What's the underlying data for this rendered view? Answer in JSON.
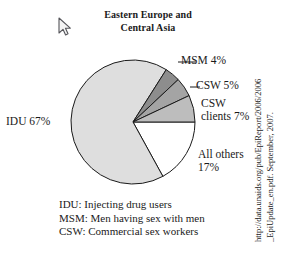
{
  "figure": {
    "title_line1": "Eastern Europe and",
    "title_line2": "Central Asia"
  },
  "cursor": {
    "icon": "mouse-pointer-arrow-icon",
    "x": 57,
    "y": 17
  },
  "labels": {
    "idu": "IDU 67%",
    "msm": "MSM 4%",
    "csw": "CSW 5%",
    "csw_clients_line1": "CSW",
    "csw_clients_line2": "clients 7%",
    "all_others_line1": "All others",
    "all_others_line2": "17%"
  },
  "legend": {
    "items": [
      "IDU: Injecting drug users",
      "MSM: Men having sex with men",
      "CSW: Commercial sex workers"
    ]
  },
  "source": {
    "line1": "http://data.unaids.org/pub/EpiReport/2006/2006",
    "line2": "_EpiUpdate_en.pdf. September, 2007."
  },
  "chart_data": {
    "type": "pie",
    "title": "Eastern Europe and Central Asia",
    "subtitle": "",
    "xlabel": "",
    "ylabel": "",
    "unit": "percent",
    "legend_position": "bottom",
    "grid": false,
    "start_angle_deg": 0,
    "direction": "clockwise",
    "center": {
      "x": 133,
      "y": 122
    },
    "radius": 62,
    "categories": [
      "IDU",
      "MSM",
      "CSW",
      "CSW clients",
      "All others"
    ],
    "values": [
      67,
      4,
      5,
      7,
      17
    ],
    "colors": [
      "#dedede",
      "#8d8d8d",
      "#a4a4a4",
      "#bdbdbd",
      "#ffffff"
    ],
    "stroke": "#1a1a1a",
    "slices": [
      {
        "label": "IDU 67%",
        "category": "IDU",
        "value": 67,
        "color": "#dedede",
        "label_position": "outside-left"
      },
      {
        "label": "MSM 4%",
        "category": "MSM",
        "value": 4,
        "color": "#8d8d8d",
        "label_position": "outside-right"
      },
      {
        "label": "CSW 5%",
        "category": "CSW",
        "value": 5,
        "color": "#a4a4a4",
        "label_position": "outside-right"
      },
      {
        "label": "CSW clients 7%",
        "category": "CSW clients",
        "value": 7,
        "color": "#bdbdbd",
        "label_position": "outside-right"
      },
      {
        "label": "All others 17%",
        "category": "All others",
        "value": 17,
        "color": "#ffffff",
        "label_position": "outside-right"
      }
    ],
    "annotations": [
      "IDU: Injecting drug users",
      "MSM: Men having sex with men",
      "CSW: Commercial sex workers"
    ]
  }
}
